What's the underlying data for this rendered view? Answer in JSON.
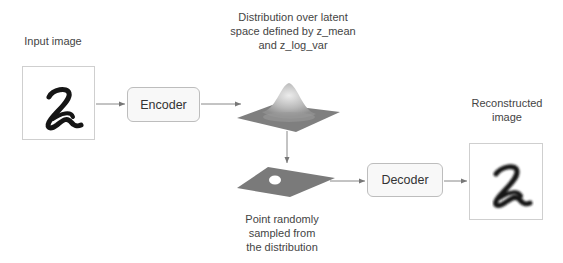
{
  "labels": {
    "input": "Input image",
    "distribution": [
      "Distribution over latent",
      "space defined by z_mean",
      "and z_log_var"
    ],
    "sampled": [
      "Point randomly",
      "sampled from",
      "the distribution"
    ],
    "reconstructed": [
      "Reconstructed",
      "image"
    ]
  },
  "nodes": {
    "encoder": "Encoder",
    "decoder": "Decoder"
  },
  "images": {
    "input_digit": "2",
    "output_digit": "2"
  }
}
